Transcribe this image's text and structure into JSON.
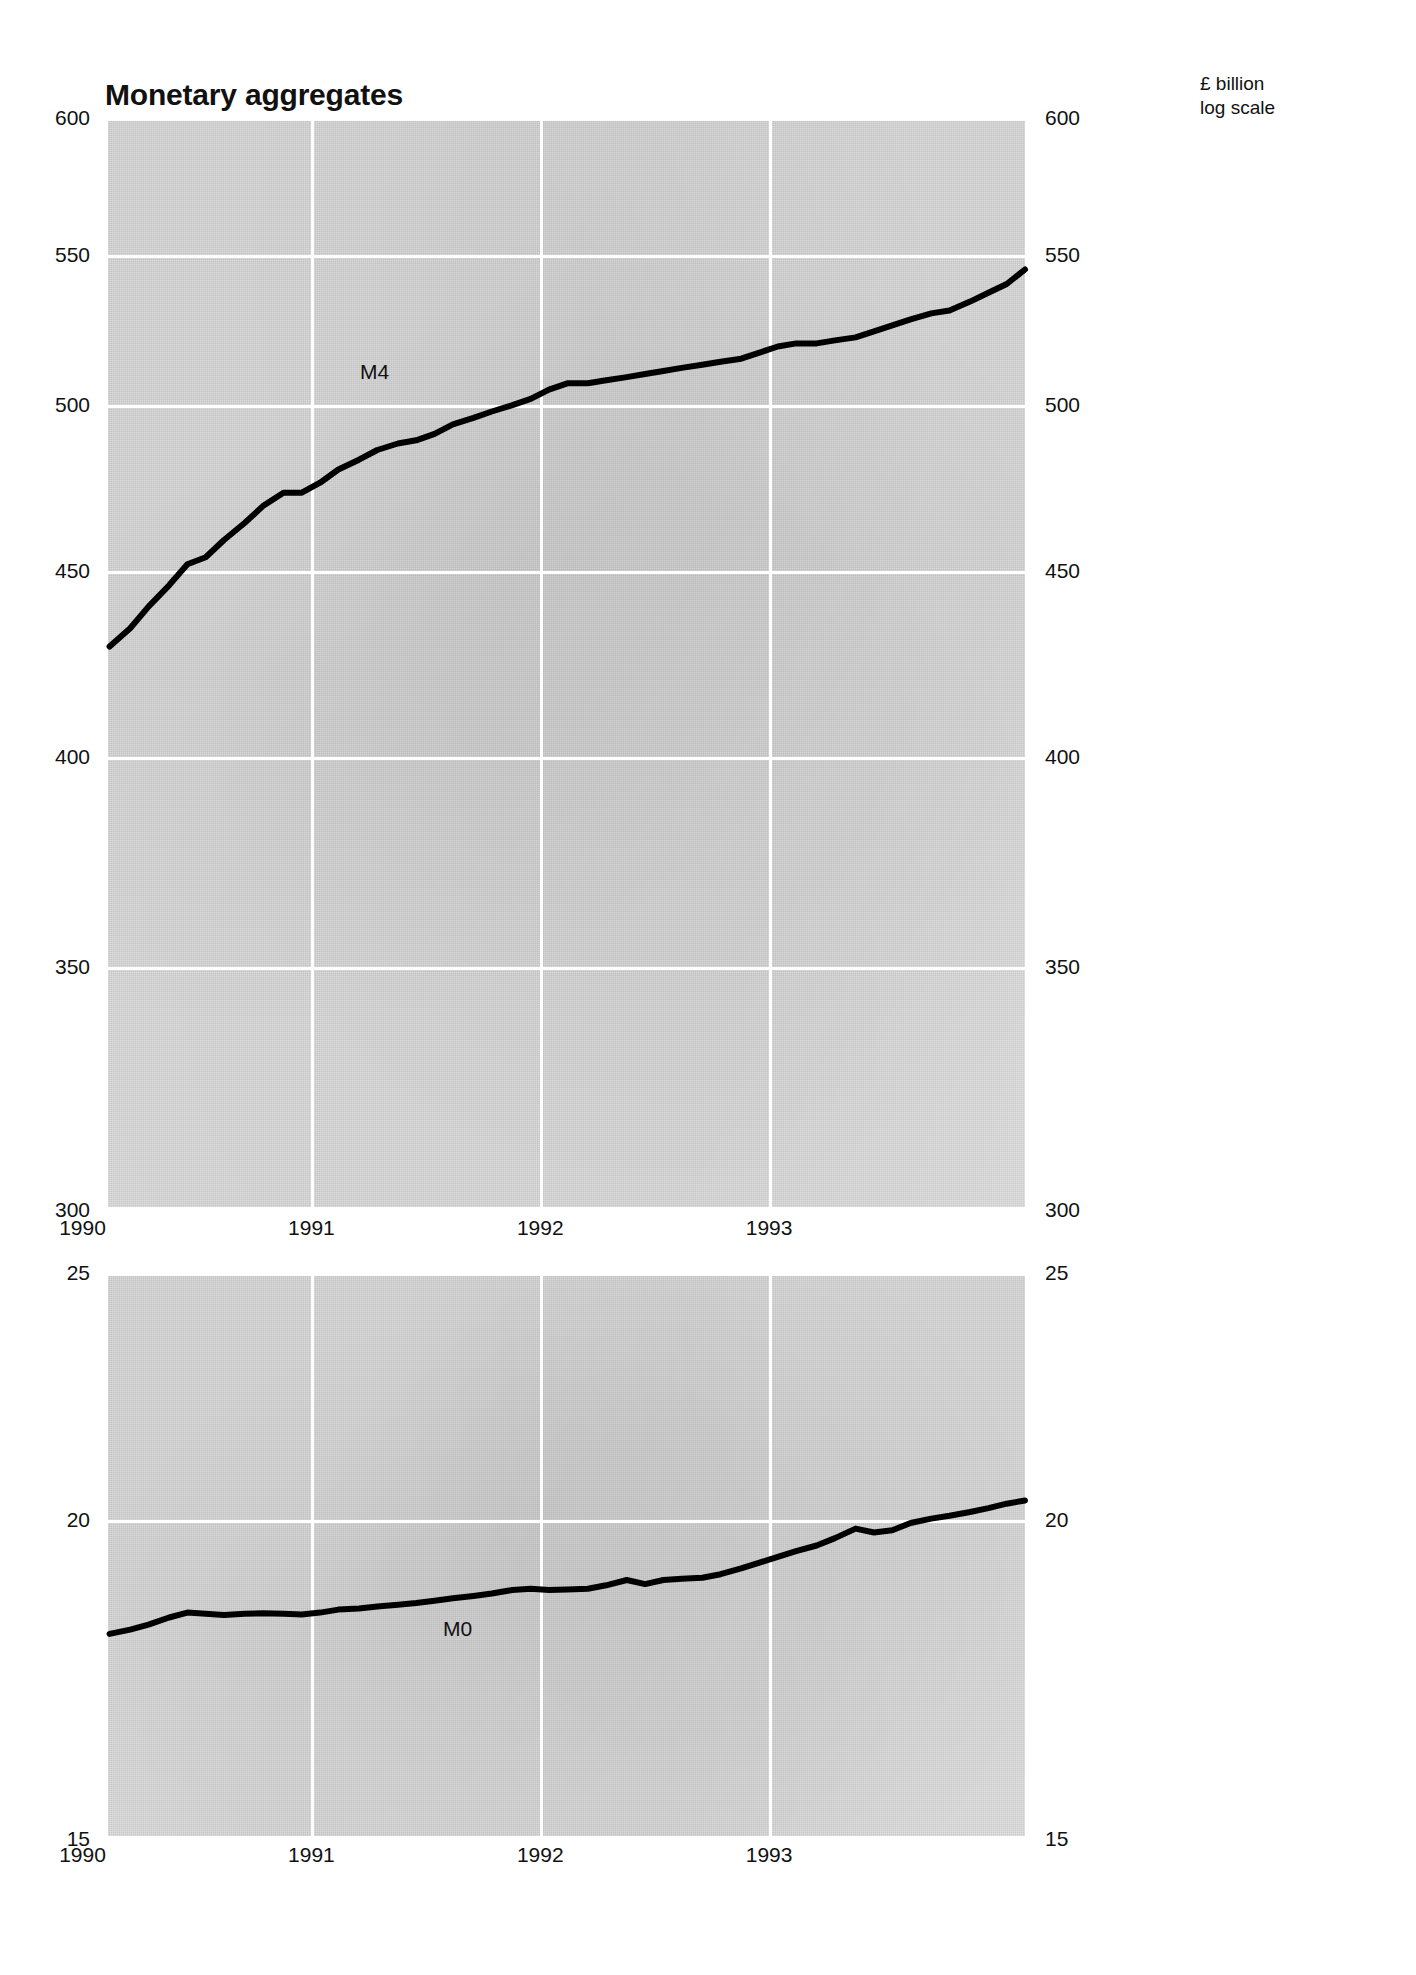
{
  "header": {
    "title": "Monetary aggregates",
    "units_line1": "£ billion",
    "units_line2": "log scale"
  },
  "chart_data": [
    {
      "id": "m4",
      "type": "line",
      "title": "Monetary aggregates",
      "subtitle": "£ billion, log scale",
      "xlabel": "",
      "ylabel": "£ billion",
      "scale": "log",
      "grid": true,
      "legend": "inline-annotation",
      "series_label": "M4",
      "ylim": [
        300,
        600
      ],
      "yticks": [
        600,
        550,
        500,
        450,
        400,
        350,
        300
      ],
      "ytick_labels_left": [
        "600",
        "550",
        "500",
        "450",
        "400",
        "350",
        "300"
      ],
      "ytick_labels_right": [
        "600",
        "550",
        "500",
        "450",
        "400",
        "350",
        "300"
      ],
      "xlim": [
        1989.6,
        1993.62
      ],
      "xticks": [
        1990,
        1991,
        1992,
        1993
      ],
      "xtick_labels": [
        "1990",
        "1991",
        "1992",
        "1993"
      ],
      "series": [
        {
          "name": "M4",
          "x": [
            1989.62,
            1989.71,
            1989.79,
            1989.88,
            1989.96,
            1990.04,
            1990.12,
            1990.21,
            1990.29,
            1990.38,
            1990.46,
            1990.54,
            1990.62,
            1990.71,
            1990.79,
            1990.88,
            1990.96,
            1991.04,
            1991.12,
            1991.21,
            1991.29,
            1991.38,
            1991.46,
            1991.54,
            1991.62,
            1991.71,
            1991.79,
            1991.88,
            1991.96,
            1992.04,
            1992.12,
            1992.21,
            1992.29,
            1992.38,
            1992.46,
            1992.54,
            1992.62,
            1992.71,
            1992.79,
            1992.88,
            1992.96,
            1993.04,
            1993.12,
            1993.21,
            1993.29,
            1993.38,
            1993.46,
            1993.54,
            1993.62
          ],
          "values": [
            429,
            434,
            440,
            446,
            452,
            454,
            459,
            464,
            469,
            473,
            473,
            476,
            480,
            483,
            486,
            488,
            489,
            491,
            494,
            496,
            498,
            500,
            502,
            505,
            507,
            507,
            508,
            509,
            510,
            511,
            512,
            513,
            514,
            515,
            517,
            519,
            520,
            520,
            521,
            522,
            524,
            526,
            528,
            530,
            531,
            534,
            537,
            540,
            545
          ]
        }
      ]
    },
    {
      "id": "m0",
      "type": "line",
      "title": "",
      "xlabel": "",
      "ylabel": "£ billion",
      "scale": "log",
      "grid": true,
      "legend": "inline-annotation",
      "series_label": "M0",
      "ylim": [
        15,
        25
      ],
      "yticks": [
        25,
        20,
        15
      ],
      "ytick_labels_left": [
        "25",
        "20",
        "15"
      ],
      "ytick_labels_right": [
        "25",
        "20",
        "15"
      ],
      "xlim": [
        1989.6,
        1993.62
      ],
      "xticks": [
        1990,
        1991,
        1992,
        1993
      ],
      "xtick_labels": [
        "1990",
        "1991",
        "1992",
        "1993"
      ],
      "series": [
        {
          "name": "M0",
          "x": [
            1989.62,
            1989.71,
            1989.79,
            1989.88,
            1989.96,
            1990.04,
            1990.12,
            1990.21,
            1990.29,
            1990.38,
            1990.46,
            1990.54,
            1990.62,
            1990.71,
            1990.79,
            1990.88,
            1990.96,
            1991.04,
            1991.12,
            1991.21,
            1991.29,
            1991.38,
            1991.46,
            1991.54,
            1991.62,
            1991.71,
            1991.79,
            1991.88,
            1991.96,
            1992.04,
            1992.12,
            1992.21,
            1992.29,
            1992.38,
            1992.46,
            1992.54,
            1992.62,
            1992.71,
            1992.79,
            1992.88,
            1992.96,
            1993.04,
            1993.12,
            1993.21,
            1993.29,
            1993.38,
            1993.46,
            1993.54,
            1993.62
          ],
          "values": [
            18.05,
            18.12,
            18.2,
            18.32,
            18.4,
            18.38,
            18.36,
            18.38,
            18.39,
            18.38,
            18.37,
            18.4,
            18.45,
            18.47,
            18.5,
            18.53,
            18.56,
            18.6,
            18.64,
            18.68,
            18.72,
            18.78,
            18.8,
            18.78,
            18.79,
            18.8,
            18.86,
            18.95,
            18.88,
            18.95,
            18.97,
            18.99,
            19.05,
            19.15,
            19.25,
            19.35,
            19.45,
            19.55,
            19.68,
            19.85,
            19.78,
            19.82,
            19.95,
            20.03,
            20.08,
            20.15,
            20.22,
            20.3,
            20.36
          ]
        }
      ]
    }
  ]
}
